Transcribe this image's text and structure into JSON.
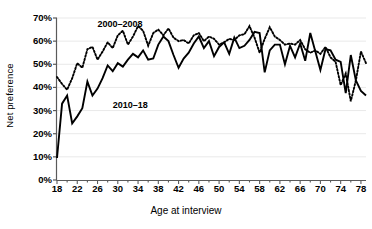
{
  "chart_data": {
    "type": "line",
    "title": "",
    "xlabel": "Age at interview",
    "ylabel": "Net preference",
    "xlim": [
      18,
      79
    ],
    "ylim": [
      0,
      0.7
    ],
    "ytick_labels": [
      "0%",
      "10%",
      "20%",
      "30%",
      "40%",
      "50%",
      "60%",
      "70%"
    ],
    "ytick_values": [
      0,
      10,
      20,
      30,
      40,
      50,
      60,
      70
    ],
    "xtick_labels": [
      "18",
      "22",
      "26",
      "30",
      "34",
      "38",
      "42",
      "46",
      "50",
      "54",
      "58",
      "62",
      "66",
      "70",
      "74",
      "78"
    ],
    "xtick_values": [
      18,
      22,
      26,
      30,
      34,
      38,
      42,
      46,
      50,
      54,
      58,
      62,
      66,
      70,
      74,
      78
    ],
    "minor_xticks": true,
    "grid": "horizontal-light",
    "legend_position": "inline-annotations",
    "series": [
      {
        "name": "2000–2008",
        "style": "dotted",
        "color": "#000000",
        "label_x": 26,
        "label_y": 67,
        "x": [
          18,
          19,
          20,
          21,
          22,
          23,
          24,
          25,
          26,
          27,
          28,
          29,
          30,
          31,
          32,
          33,
          34,
          35,
          36,
          37,
          38,
          39,
          40,
          41,
          42,
          43,
          44,
          45,
          46,
          47,
          48,
          49,
          50,
          51,
          52,
          53,
          54,
          55,
          56,
          57,
          58,
          59,
          60,
          61,
          62,
          63,
          64,
          65,
          66,
          67,
          68,
          69,
          70,
          71,
          72,
          73,
          74,
          75,
          76,
          77,
          78,
          79
        ],
        "values": [
          44.5,
          41.5,
          39.0,
          44.0,
          50.5,
          48.5,
          56.5,
          57.5,
          52.0,
          55.5,
          59.5,
          57.0,
          62.5,
          64.5,
          58.5,
          62.0,
          66.5,
          64.5,
          58.0,
          63.5,
          65.0,
          62.5,
          65.5,
          61.5,
          60.0,
          60.5,
          59.0,
          62.5,
          63.5,
          60.0,
          62.0,
          61.0,
          58.5,
          59.5,
          61.0,
          60.5,
          62.5,
          63.0,
          66.5,
          61.5,
          55.0,
          61.0,
          66.0,
          62.0,
          60.5,
          58.5,
          59.0,
          58.5,
          60.5,
          56.5,
          55.0,
          56.0,
          54.5,
          57.5,
          53.0,
          51.0,
          41.0,
          46.0,
          34.0,
          43.0,
          55.5,
          50.5
        ]
      },
      {
        "name": "2010–18",
        "style": "solid",
        "color": "#000000",
        "label_x": 29,
        "label_y": 32,
        "x": [
          18,
          19,
          20,
          21,
          22,
          23,
          24,
          25,
          26,
          27,
          28,
          29,
          30,
          31,
          32,
          33,
          34,
          35,
          36,
          37,
          38,
          39,
          40,
          41,
          42,
          43,
          44,
          45,
          46,
          47,
          48,
          49,
          50,
          51,
          52,
          53,
          54,
          55,
          56,
          57,
          58,
          59,
          60,
          61,
          62,
          63,
          64,
          65,
          66,
          67,
          68,
          69,
          70,
          71,
          72,
          73,
          74,
          75,
          76,
          77,
          78,
          79
        ],
        "values": [
          9.5,
          33.0,
          36.5,
          24.5,
          27.5,
          31.0,
          42.5,
          36.5,
          39.5,
          44.0,
          49.5,
          47.0,
          50.5,
          49.0,
          52.0,
          54.5,
          53.0,
          56.0,
          52.0,
          52.5,
          58.5,
          62.0,
          60.0,
          54.0,
          48.5,
          52.5,
          55.0,
          59.0,
          62.0,
          57.0,
          60.0,
          53.5,
          57.5,
          59.5,
          54.5,
          61.5,
          57.0,
          58.0,
          60.5,
          64.0,
          63.5,
          46.5,
          56.0,
          58.5,
          58.5,
          50.0,
          58.0,
          53.0,
          59.0,
          51.5,
          63.5,
          55.5,
          47.5,
          56.5,
          56.0,
          52.0,
          51.0,
          37.5,
          54.0,
          43.0,
          38.5,
          36.5
        ]
      }
    ]
  },
  "axes": {
    "y_title": "Net preference",
    "x_title": "Age at interview"
  }
}
